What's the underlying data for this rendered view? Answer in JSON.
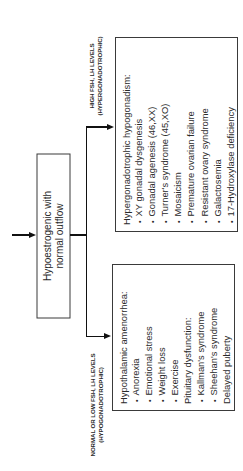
{
  "diagram": {
    "orientation": "rotated -90deg (text reads bottom-to-top)",
    "source_node": {
      "label_line1": "Hypoestrogenic with",
      "label_line2": "normal outflow"
    },
    "branches": [
      {
        "id": "high",
        "label_line1": "HIGH FSH, LH LEVELS",
        "label_line2": "(HYPERGONADOTROPHIC)",
        "box": {
          "title": "Hypergonadotrophic hypogonadism:",
          "items": [
            {
              "type": "bullet",
              "text": "XY gonadal dysgenesis"
            },
            {
              "type": "bullet",
              "text": "Gonadal agenesis (46,XX)"
            },
            {
              "type": "bullet",
              "text": "Turner's syndrome (45,XO)"
            },
            {
              "type": "bullet",
              "text": "Mosaicism"
            },
            {
              "type": "bullet",
              "text": "Premature ovarian failure"
            },
            {
              "type": "bullet",
              "text": "Resistant ovary syndrome"
            },
            {
              "type": "bullet",
              "text": "Galactosemia"
            },
            {
              "type": "bullet",
              "text": "17-Hydroxylase deficiency"
            }
          ]
        }
      },
      {
        "id": "low",
        "label_line1": "NORMAL OR LOW FSH, LH LEVELS",
        "label_line2": "(HYPOGONADOTROPHIC)",
        "box": {
          "title": "Hypothalamic amenorrhea:",
          "items": [
            {
              "type": "bullet",
              "text": "Anorexia"
            },
            {
              "type": "bullet",
              "text": "Emotional stress"
            },
            {
              "type": "bullet",
              "text": "Weight loss"
            },
            {
              "type": "bullet",
              "text": "Exercise"
            },
            {
              "type": "heading",
              "text": "Pituitary dysfunction:"
            },
            {
              "type": "bullet",
              "text": "Kallman's syndrome"
            },
            {
              "type": "bullet",
              "text": "Sheehan's syndrome"
            },
            {
              "type": "heading",
              "text": "Delayed puberty"
            }
          ]
        }
      }
    ]
  }
}
